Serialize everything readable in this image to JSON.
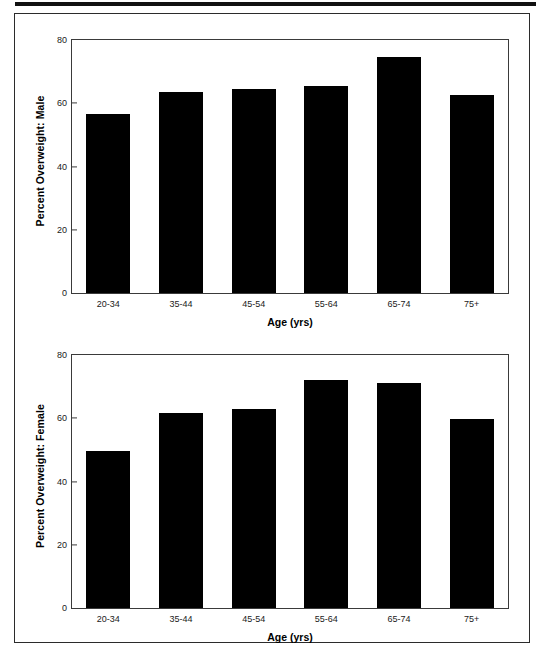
{
  "figure": {
    "background_color": "#ffffff",
    "bar_color": "#000000",
    "axis_color": "#3a3a3a",
    "frame_color": "#2b2b2b"
  },
  "chart_data": [
    {
      "type": "bar",
      "title": "",
      "panel": "male",
      "categories": [
        "20-34",
        "35-44",
        "45-54",
        "55-64",
        "65-74",
        "75+"
      ],
      "values": [
        56.5,
        63.5,
        64.5,
        65.5,
        74.5,
        62.5
      ],
      "xlabel": "Age (yrs)",
      "ylabel": "Percent Overweight: Male",
      "ylim": [
        0,
        80
      ],
      "yticks": [
        0,
        20,
        40,
        60,
        80
      ],
      "ytick_labels": [
        "0",
        "20",
        "40",
        "60",
        "80"
      ],
      "grid": false,
      "legend": false
    },
    {
      "type": "bar",
      "title": "",
      "panel": "female",
      "categories": [
        "20-34",
        "35-44",
        "45-54",
        "55-64",
        "65-74",
        "75+"
      ],
      "values": [
        49.8,
        61.8,
        62.8,
        72.0,
        71.0,
        59.8
      ],
      "xlabel": "Age (yrs)",
      "ylabel": "Percent Overweight: Female",
      "ylim": [
        0,
        80
      ],
      "yticks": [
        0,
        20,
        40,
        60,
        80
      ],
      "ytick_labels": [
        "0",
        "20",
        "40",
        "60",
        "80"
      ],
      "grid": false,
      "legend": false
    }
  ]
}
